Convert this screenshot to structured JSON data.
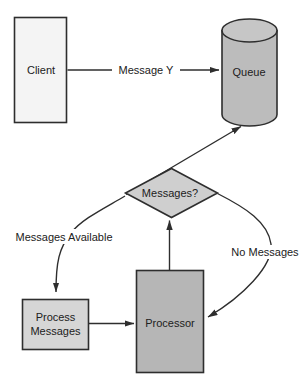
{
  "colors": {
    "background": "#ffffff",
    "stroke": "#2e2e2e",
    "text": "#212121",
    "client_fill": "#f4f4f4",
    "queue_fill": "#bcbcbc",
    "queue_top_fill": "#c6c6c6",
    "decision_fill": "#cfcfcf",
    "process_messages_fill": "#d6d6d6",
    "processor_fill": "#b6b6b6"
  },
  "nodes": {
    "client": {
      "label": "Client"
    },
    "queue": {
      "label": "Queue"
    },
    "decision": {
      "label": "Messages?"
    },
    "process_messages": {
      "line1": "Process",
      "line2": "Messages"
    },
    "processor": {
      "label": "Processor"
    }
  },
  "edges": {
    "client_to_queue": {
      "label": "Message Y"
    },
    "decision_to_process_messages": {
      "label": "Messages Available"
    },
    "decision_to_processor": {
      "label": "No Messages"
    }
  }
}
